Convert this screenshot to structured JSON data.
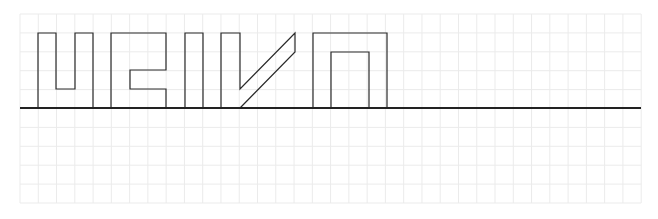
{
  "diagram": {
    "type": "grid-lettering",
    "grid": {
      "x0": 20,
      "y0": 14,
      "columns": 34,
      "rows": 10,
      "cell_w": 18.27,
      "cell_h": 18.9,
      "line_color": "#ebebeb"
    },
    "baseline": {
      "x1": 20,
      "x2": 641,
      "y": 108,
      "color": "#222222"
    },
    "stroke_color": "#2a2a2a",
    "glyphs": [
      {
        "name": "glyph-u",
        "points": "38,108 38,33 56,33 56,89 75,89 75,33 93,33 93,108"
      },
      {
        "name": "glyph-hook",
        "points": "111,108 111,33 166,33 166,70 130,70 130,89 166,89 166,108"
      },
      {
        "name": "glyph-bar",
        "points": "185,108 185,33 203,33 203,108"
      },
      {
        "name": "glyph-check",
        "points": "221,108 221,33 240,33 240,89 295,33 295,52 240,108"
      },
      {
        "name": "glyph-arch",
        "points": "313,108 313,33 387,33 387,108 369,108 369,52 331,52 331,108"
      }
    ]
  }
}
